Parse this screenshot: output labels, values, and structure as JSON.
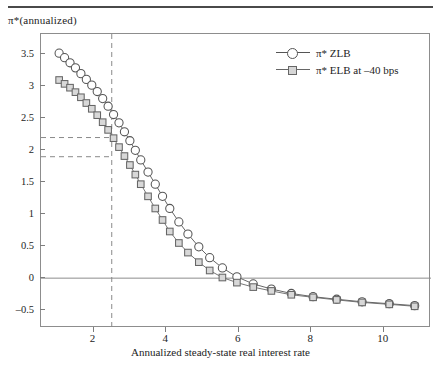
{
  "figure": {
    "y_axis_title": "π*(annualized)",
    "x_axis_title": "Annualized steady-state real interest rate"
  },
  "legend": {
    "items": [
      {
        "label": "π* ZLB",
        "marker": "circle",
        "color": "#555555"
      },
      {
        "label": "π* ELB at –40 bps",
        "marker": "square",
        "color": "#666666"
      }
    ]
  },
  "chart_data": {
    "type": "line",
    "title": "",
    "xlabel": "Annualized steady-state real interest rate",
    "ylabel": "π*(annualized)",
    "xlim": [
      0.55,
      11.3
    ],
    "ylim": [
      -0.78,
      3.82
    ],
    "xticks": [
      2,
      4,
      6,
      8,
      10
    ],
    "xticklabels": [
      "2",
      "4",
      "6",
      "8",
      "10"
    ],
    "yticks": [
      3.5,
      3,
      2.5,
      2,
      1.5,
      1,
      0.5,
      0,
      -0.5
    ],
    "yticklabels": [
      "3.5",
      "3",
      "2.5",
      "2",
      "1.5",
      "1",
      "0.5",
      "0",
      "–0.5"
    ],
    "grid": false,
    "legend_position": "top-right",
    "zero_line": 0,
    "annotations": [
      {
        "type": "vline",
        "x": 2.5,
        "style": "dashed",
        "color": "#8a8a8a"
      },
      {
        "type": "hline",
        "y": 2.2,
        "style": "dashed",
        "color": "#8a8a8a",
        "x_end": 2.5
      },
      {
        "type": "hline",
        "y": 1.9,
        "style": "dashed",
        "color": "#8a8a8a",
        "x_end": 2.5
      }
    ],
    "series": [
      {
        "name": "π* ZLB",
        "marker": "circle",
        "color": "#555555",
        "x": [
          1.05,
          1.2,
          1.35,
          1.5,
          1.65,
          1.8,
          1.95,
          2.1,
          2.25,
          2.4,
          2.55,
          2.7,
          2.85,
          3.0,
          3.15,
          3.3,
          3.5,
          3.7,
          3.9,
          4.1,
          4.35,
          4.6,
          4.9,
          5.2,
          5.55,
          5.95,
          6.4,
          6.9,
          7.45,
          8.05,
          8.7,
          9.4,
          10.15,
          10.85
        ],
        "y": [
          3.52,
          3.45,
          3.37,
          3.29,
          3.2,
          3.11,
          3.02,
          2.92,
          2.81,
          2.69,
          2.56,
          2.43,
          2.29,
          2.15,
          2.0,
          1.85,
          1.66,
          1.47,
          1.28,
          1.09,
          0.88,
          0.69,
          0.49,
          0.32,
          0.16,
          0.02,
          -0.09,
          -0.17,
          -0.24,
          -0.29,
          -0.33,
          -0.37,
          -0.4,
          -0.43
        ]
      },
      {
        "name": "π* ELB at –40 bps",
        "marker": "square",
        "color": "#666666",
        "x": [
          1.05,
          1.2,
          1.35,
          1.5,
          1.65,
          1.8,
          1.95,
          2.1,
          2.25,
          2.4,
          2.55,
          2.7,
          2.85,
          3.0,
          3.15,
          3.3,
          3.5,
          3.7,
          3.9,
          4.1,
          4.35,
          4.6,
          4.9,
          5.2,
          5.55,
          5.95,
          6.4,
          6.9,
          7.45,
          8.05,
          8.7,
          9.4,
          10.15,
          10.85
        ],
        "y": [
          3.1,
          3.04,
          2.98,
          2.91,
          2.83,
          2.74,
          2.65,
          2.55,
          2.44,
          2.32,
          2.19,
          2.05,
          1.91,
          1.77,
          1.62,
          1.47,
          1.28,
          1.09,
          0.91,
          0.73,
          0.55,
          0.4,
          0.25,
          0.12,
          0.01,
          -0.07,
          -0.14,
          -0.2,
          -0.26,
          -0.3,
          -0.34,
          -0.38,
          -0.41,
          -0.44
        ]
      }
    ]
  }
}
